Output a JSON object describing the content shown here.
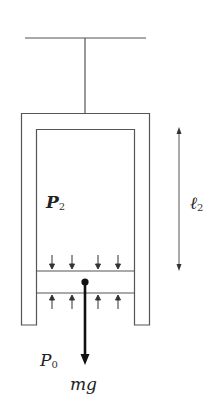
{
  "diagram": {
    "type": "physics-cylinder-piston",
    "labels": {
      "inner_pressure": {
        "main": "P",
        "sub": "2"
      },
      "outer_pressure": {
        "main": "P",
        "sub": "0"
      },
      "length": {
        "main": "ℓ",
        "sub": "2"
      },
      "weight": "mg"
    },
    "colors": {
      "line": "#555555",
      "bold": "#111111",
      "background": "#ffffff"
    }
  }
}
